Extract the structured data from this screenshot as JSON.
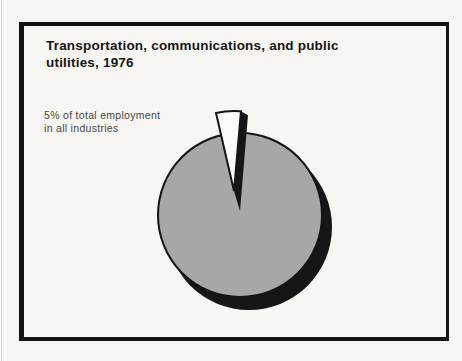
{
  "page": {
    "background_color": "#f7f6f2",
    "frame_color": "#141414"
  },
  "title": {
    "line1": "Transportation, communications, and public",
    "line2": "utilities, 1976"
  },
  "annotation": {
    "line1": "5% of total employment",
    "line2": "in all industries"
  },
  "chart_data": {
    "type": "pie",
    "title": "Transportation, communications, and public utilities, 1976",
    "annotation": "5% of total employment in all industries",
    "slices": [
      {
        "label": "Transportation, communications, and public utilities",
        "value": 5,
        "exploded": true,
        "color": "#fbfaf6"
      },
      {
        "label": "All other industries",
        "value": 95,
        "exploded": false,
        "color": "#a7a7a5"
      }
    ],
    "outline_color": "#151515",
    "shadow_color": "#161616",
    "legend": "none",
    "start_angle_deg": -85,
    "explode_direction": "up-left"
  }
}
